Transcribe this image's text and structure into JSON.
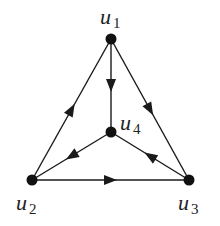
{
  "diagram": {
    "type": "directed-graph",
    "nodes": [
      {
        "id": "u1",
        "base": "u",
        "sub": "1",
        "x": 111,
        "y": 39,
        "lx": 100,
        "ly": 24
      },
      {
        "id": "u2",
        "base": "u",
        "sub": "2",
        "x": 32,
        "y": 180,
        "lx": 16,
        "ly": 210
      },
      {
        "id": "u3",
        "base": "u",
        "sub": "3",
        "x": 189,
        "y": 180,
        "lx": 178,
        "ly": 210
      },
      {
        "id": "u4",
        "base": "u",
        "sub": "4",
        "x": 111,
        "y": 132,
        "lx": 120,
        "ly": 130
      }
    ],
    "edges": [
      {
        "from": "u2",
        "to": "u1"
      },
      {
        "from": "u1",
        "to": "u3"
      },
      {
        "from": "u1",
        "to": "u4"
      },
      {
        "from": "u4",
        "to": "u2"
      },
      {
        "from": "u3",
        "to": "u4"
      },
      {
        "from": "u2",
        "to": "u3"
      }
    ],
    "colors": {
      "stroke": "#1a1a1a",
      "node": "#111111",
      "background": "#ffffff"
    }
  }
}
